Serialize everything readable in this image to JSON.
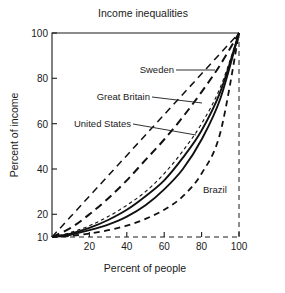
{
  "chart_data": {
    "type": "line",
    "title": "Income inequalities",
    "xlabel": "Percent of people",
    "ylabel": "Percent of income",
    "xlim": [
      0,
      100
    ],
    "ylim": [
      10,
      100
    ],
    "grid": false,
    "legend_position": "inline-labels",
    "xticks": [
      20,
      40,
      60,
      80,
      100
    ],
    "xtick_labels": [
      "20",
      "40",
      "60",
      "80",
      "100"
    ],
    "yticks": [
      10,
      20,
      40,
      60,
      80,
      100
    ],
    "ytick_labels": [
      "10",
      "20",
      "40",
      "60",
      "80",
      "100"
    ],
    "x": [
      0,
      10,
      20,
      30,
      40,
      50,
      60,
      70,
      80,
      90,
      100
    ],
    "series": [
      {
        "name": "Equality line",
        "style": "dashed",
        "labeled": false,
        "values": [
          10,
          19,
          28,
          37,
          46,
          55,
          64,
          73,
          82,
          91,
          100
        ]
      },
      {
        "name": "Sweden",
        "style": "long-dash",
        "labeled": true,
        "values": [
          10,
          14,
          20,
          27,
          35,
          44,
          53,
          63,
          74,
          86,
          100
        ]
      },
      {
        "name": "Great Britain",
        "style": "fine-dash",
        "labeled": true,
        "values": [
          10,
          12,
          15,
          19,
          24,
          30,
          38,
          48,
          60,
          76,
          100
        ]
      },
      {
        "name": "United States",
        "style": "solid",
        "labeled": true,
        "values": [
          10,
          11.5,
          14,
          17.5,
          22,
          28,
          35,
          45,
          57,
          74,
          100
        ]
      },
      {
        "name": "United States lower",
        "style": "solid",
        "labeled": false,
        "values": [
          10,
          11,
          13,
          15.5,
          19,
          24,
          31,
          40,
          53,
          71,
          100
        ]
      },
      {
        "name": "Brazil",
        "style": "dashed",
        "labeled": true,
        "values": [
          10,
          10.5,
          11.5,
          13,
          15,
          18,
          22,
          28,
          38,
          56,
          100
        ]
      }
    ],
    "annotations": [
      {
        "text": "Sweden",
        "x": 54,
        "y": 83
      },
      {
        "text": "Great Britain",
        "x": 38,
        "y": 68
      },
      {
        "text": "United States",
        "x": 26,
        "y": 54
      },
      {
        "text": "Brazil",
        "x": 79,
        "y": 26
      }
    ]
  }
}
